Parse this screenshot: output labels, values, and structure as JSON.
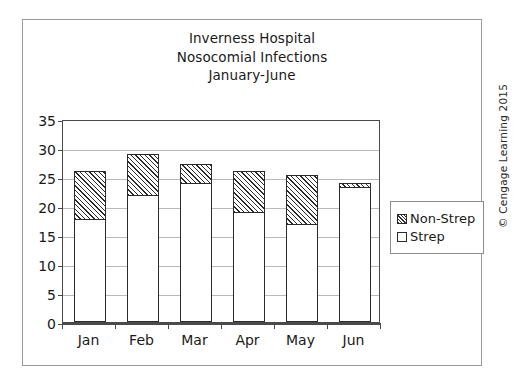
{
  "credit": "© Cengage Learning 2015",
  "legend": {
    "items": [
      {
        "label": "Non-Strep",
        "swatch": "hatched-swatch"
      },
      {
        "label": "Strep",
        "swatch": "white-swatch"
      }
    ]
  },
  "chart_data": {
    "type": "bar",
    "subtype": "stacked",
    "title": "Inverness Hospital Nosocomial Infections January-June",
    "title_lines": [
      "Inverness Hospital",
      "Nosocomial Infections",
      "January-June"
    ],
    "xlabel": "",
    "ylabel": "",
    "categories": [
      "Jan",
      "Feb",
      "Mar",
      "Apr",
      "May",
      "Jun"
    ],
    "series": [
      {
        "name": "Strep",
        "values": [
          17.8,
          22.0,
          24.0,
          19.1,
          17.0,
          23.3
        ]
      },
      {
        "name": "Non-Strep",
        "values": [
          8.2,
          7.0,
          3.3,
          7.0,
          8.3,
          0.7
        ]
      }
    ],
    "totals": [
      26.0,
      29.0,
      27.3,
      26.1,
      25.3,
      24.0
    ],
    "ylim": [
      0,
      35
    ],
    "yticks": [
      0,
      5,
      10,
      15,
      20,
      25,
      30,
      35
    ],
    "ytick_labels": [
      "0",
      "5",
      "10",
      "15",
      "20",
      "25",
      "30",
      "35"
    ],
    "grid": true,
    "grid_axis": "y",
    "legend_position": "right"
  }
}
